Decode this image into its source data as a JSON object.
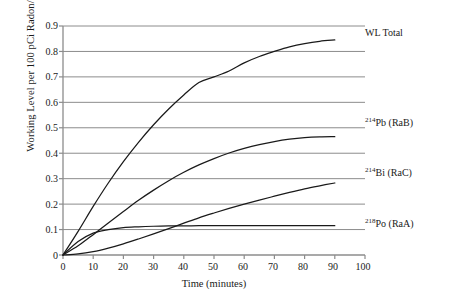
{
  "chart_data": {
    "type": "line",
    "title": "",
    "xlabel": "Time (minutes)",
    "ylabel": "Working Level per 100 pCi Radon/Liter",
    "xlim": [
      0,
      100
    ],
    "ylim": [
      0,
      0.9
    ],
    "xticks": [
      "0",
      "10",
      "20",
      "30",
      "40",
      "50",
      "60",
      "70",
      "80",
      "90",
      "100"
    ],
    "yticks": [
      "0",
      "0.1",
      "0.2",
      "0.3",
      "0.4",
      "0.5",
      "0.6",
      "0.7",
      "0.8",
      "0.9"
    ],
    "grid": "horizontal",
    "legend_position": "right-inline",
    "x": [
      0,
      5,
      10,
      15,
      20,
      25,
      30,
      35,
      40,
      45,
      50,
      55,
      60,
      65,
      70,
      75,
      80,
      85,
      90
    ],
    "series": [
      {
        "name": "WL Total",
        "label_html": "WL Total",
        "values": [
          0,
          0.093,
          0.191,
          0.283,
          0.367,
          0.443,
          0.512,
          0.574,
          0.629,
          0.678,
          0.7,
          0.723,
          0.755,
          0.78,
          0.8,
          0.818,
          0.831,
          0.84,
          0.845
        ]
      },
      {
        "name": "Pb-214 (RaB)",
        "label_isotope": "214",
        "label_element": "Pb (RaB)",
        "values": [
          0,
          0.036,
          0.08,
          0.126,
          0.171,
          0.215,
          0.255,
          0.292,
          0.325,
          0.354,
          0.379,
          0.401,
          0.419,
          0.434,
          0.446,
          0.455,
          0.461,
          0.464,
          0.465
        ]
      },
      {
        "name": "Bi-214 (RaC)",
        "label_isotope": "214",
        "label_element": "Bi (RaC)",
        "values": [
          0,
          0.004,
          0.013,
          0.027,
          0.044,
          0.063,
          0.083,
          0.104,
          0.125,
          0.146,
          0.165,
          0.183,
          0.2,
          0.216,
          0.231,
          0.246,
          0.26,
          0.272,
          0.283
        ]
      },
      {
        "name": "Po-218 (RaA)",
        "label_isotope": "218",
        "label_element": "Po (RaA)",
        "values": [
          0,
          0.053,
          0.086,
          0.1,
          0.108,
          0.111,
          0.113,
          0.114,
          0.1145,
          0.115,
          0.115,
          0.115,
          0.115,
          0.115,
          0.115,
          0.115,
          0.115,
          0.115,
          0.115
        ]
      }
    ],
    "colors": {
      "line": "#1a1a1a",
      "grid": "#8c8c8c",
      "axis": "#8c8c8c",
      "text": "#1a1a1a"
    }
  }
}
